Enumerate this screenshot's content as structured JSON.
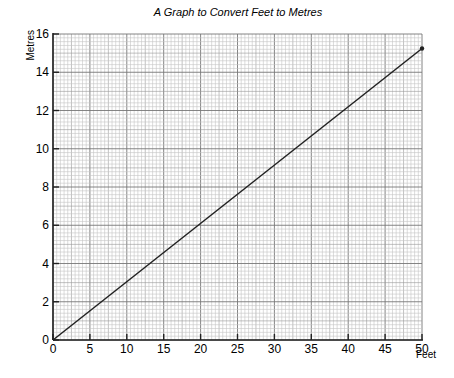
{
  "chart_data": {
    "type": "line",
    "title": "A Graph to Convert Feet to Metres",
    "xlabel": "Feet",
    "ylabel": "Metres",
    "xlim": [
      0,
      50
    ],
    "ylim": [
      0,
      16
    ],
    "x_ticks": [
      0,
      5,
      10,
      15,
      20,
      25,
      30,
      35,
      40,
      45,
      50
    ],
    "y_ticks": [
      0,
      2,
      4,
      6,
      8,
      10,
      12,
      14,
      16
    ],
    "grid": true,
    "grid_minor_x_step": 0.5,
    "grid_minor_y_step": 0.2,
    "legend": null,
    "series": [
      {
        "name": "Feet to Metres",
        "x": [
          0,
          50
        ],
        "y": [
          0,
          15.24
        ],
        "color": "#222222",
        "end_marker": true
      }
    ]
  }
}
